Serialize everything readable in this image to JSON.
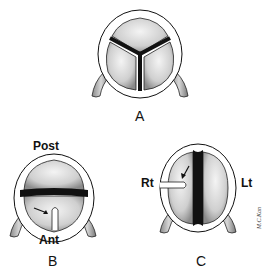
{
  "figure": {
    "panels": [
      {
        "id": "A",
        "label": "A",
        "cusps": 3,
        "orientation_labels": []
      },
      {
        "id": "B",
        "label": "B",
        "cusps": 2,
        "orientation_labels": [
          "Post",
          "Ant"
        ],
        "raphe_arrow": true
      },
      {
        "id": "C",
        "label": "C",
        "cusps": 2,
        "orientation_labels": [
          "Rt",
          "Lt"
        ],
        "raphe_arrow": true
      }
    ],
    "labels": {
      "a": "A",
      "b": "B",
      "c": "C",
      "post": "Post",
      "ant": "Ant",
      "rt": "Rt",
      "lt": "Lt",
      "signature": "M.C.Kan"
    },
    "colors": {
      "ink": "#111111",
      "cusp_fill": "#d9d9d9",
      "cusp_shade": "#9a9a9a",
      "coronary_fill": "#bdbdbd",
      "background": "#ffffff"
    }
  }
}
